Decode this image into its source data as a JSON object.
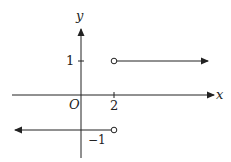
{
  "diagram": {
    "type": "step-function-graph",
    "axes": {
      "x_label": "x",
      "y_label": "y",
      "origin_label": "O"
    },
    "ticks": {
      "x_tick_label": "2",
      "y_tick_label": "1",
      "neg_y_label": "−1"
    },
    "segments": [
      {
        "description": "y = 1 for x > 2",
        "y": 1,
        "from_x": 2,
        "open_start": true,
        "direction": "right"
      },
      {
        "description": "y = -1 for x < 2",
        "y": -1,
        "to_x": 2,
        "open_end": true,
        "direction": "left"
      }
    ],
    "line_color": "#222222"
  }
}
